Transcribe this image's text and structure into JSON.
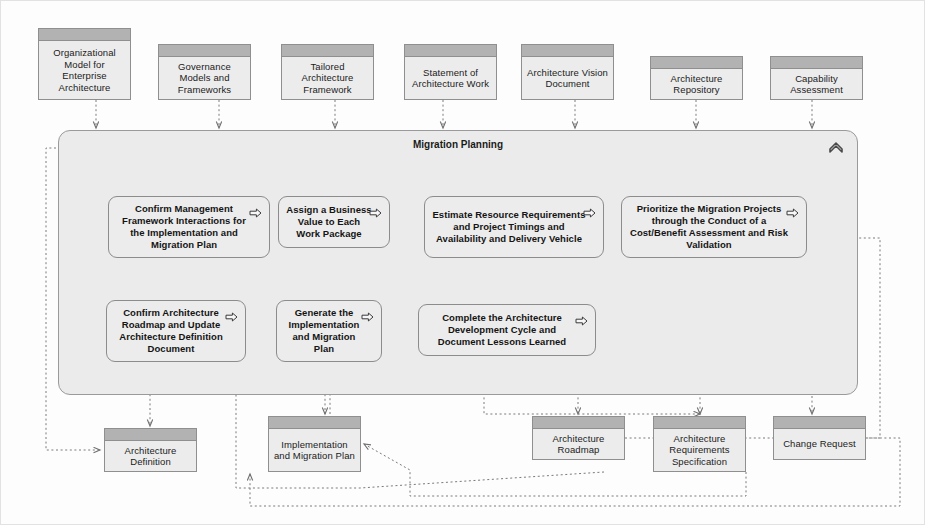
{
  "diagram": {
    "title": "Migration Planning",
    "container_icon": "chevron-up-icon",
    "process_icon": "right-arrow-outline-icon",
    "colors": {
      "artifact_band": "#b2b2b2",
      "artifact_fill": "#ececec",
      "container_fill": "#ebebeb",
      "process_fill": "#ececec",
      "border": "#8c8c8c",
      "connector_solid": "#2b2b2b",
      "connector_dotted": "#7a7a7a"
    }
  },
  "inputs": [
    {
      "label": "Organizational Model for Enterprise Architecture",
      "x": 38,
      "y": 28,
      "w": 93,
      "h": 72
    },
    {
      "label": "Governance Models and Frameworks",
      "x": 158,
      "y": 44,
      "w": 93,
      "h": 56
    },
    {
      "label": "Tailored Architecture Framework",
      "x": 281,
      "y": 44,
      "w": 93,
      "h": 56
    },
    {
      "label": "Statement of Architecture Work",
      "x": 404,
      "y": 44,
      "w": 93,
      "h": 56
    },
    {
      "label": "Architecture Vision Document",
      "x": 521,
      "y": 44,
      "w": 93,
      "h": 56
    },
    {
      "label": "Architecture Repository",
      "x": 650,
      "y": 56,
      "w": 93,
      "h": 44
    },
    {
      "label": "Capability Assessment",
      "x": 770,
      "y": 56,
      "w": 93,
      "h": 44
    }
  ],
  "container": {
    "x": 58,
    "y": 130,
    "w": 800,
    "h": 265
  },
  "processes": [
    {
      "label": "Confirm Management Framework Interactions for the Implementation and Migration Plan",
      "x": 108,
      "y": 196,
      "w": 162,
      "h": 62
    },
    {
      "label": "Assign a Business Value to Each Work Package",
      "x": 278,
      "y": 196,
      "w": 112,
      "h": 52
    },
    {
      "label": "Estimate Resource Requirements and Project Timings and Availability and Delivery Vehicle",
      "x": 424,
      "y": 196,
      "w": 180,
      "h": 62
    },
    {
      "label": "Prioritize the Migration Projects through the Conduct of a Cost/Benefit Assessment and Risk Validation",
      "x": 621,
      "y": 196,
      "w": 186,
      "h": 62
    },
    {
      "label": "Confirm Architecture Roadmap and Update Architecture Definition Document",
      "x": 106,
      "y": 300,
      "w": 140,
      "h": 62
    },
    {
      "label": "Generate the Implementation and Migration Plan",
      "x": 276,
      "y": 300,
      "w": 106,
      "h": 62
    },
    {
      "label": "Complete the Architecture Development Cycle and Document Lessons Learned",
      "x": 418,
      "y": 304,
      "w": 178,
      "h": 52
    }
  ],
  "outputs": [
    {
      "label": "Architecture Definition",
      "x": 104,
      "y": 428,
      "w": 93,
      "h": 44
    },
    {
      "label": "Implementation and Migration Plan",
      "x": 268,
      "y": 416,
      "w": 93,
      "h": 56
    },
    {
      "label": "Architecture Roadmap",
      "x": 532,
      "y": 416,
      "w": 93,
      "h": 44
    },
    {
      "label": "Architecture Requirements Specification",
      "x": 653,
      "y": 416,
      "w": 93,
      "h": 56
    },
    {
      "label": "Change Request",
      "x": 773,
      "y": 416,
      "w": 93,
      "h": 44
    }
  ]
}
